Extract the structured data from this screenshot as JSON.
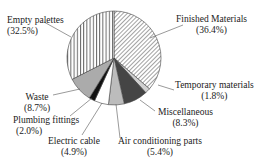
{
  "chart_data": {
    "type": "pie",
    "title": "",
    "start_angle_deg": 0,
    "direction": "clockwise",
    "slices": [
      {
        "label": "Finished Materials",
        "pct_label": "(36.4%)",
        "value": 36.4,
        "fill": "hatch-diag",
        "color": "#ffffff"
      },
      {
        "label": "Temporary materials",
        "pct_label": "(1.8%)",
        "value": 1.8,
        "fill": "solid",
        "color": "#d0d0d0"
      },
      {
        "label": "Miscellaneous",
        "pct_label": "(8.3%)",
        "value": 8.3,
        "fill": "solid",
        "color": "#454545"
      },
      {
        "label": "Air conditioning parts",
        "pct_label": "(5.4%)",
        "value": 5.4,
        "fill": "solid",
        "color": "#bcbcbc"
      },
      {
        "label": "Electric cable",
        "pct_label": "(4.9%)",
        "value": 4.9,
        "fill": "solid",
        "color": "#ffffff"
      },
      {
        "label": "Plumbing fittings",
        "pct_label": "(2.0%)",
        "value": 2.0,
        "fill": "solid",
        "color": "#111111"
      },
      {
        "label": "Waste",
        "pct_label": "(8.7%)",
        "value": 8.7,
        "fill": "solid",
        "color": "#ababab"
      },
      {
        "label": "Empty palettes",
        "pct_label": "(32.5%)",
        "value": 32.5,
        "fill": "stripe-vert",
        "color": "#ffffff"
      }
    ],
    "legend": "none (callout labels)"
  },
  "labels": {
    "finished": {
      "name": "Finished Materials",
      "pct": "(36.4%)"
    },
    "temporary": {
      "name": "Temporary materials",
      "pct": "(1.8%)"
    },
    "misc": {
      "name": "Miscellaneous",
      "pct": "(8.3%)"
    },
    "aircon": {
      "name": "Air conditioning parts",
      "pct": "(5.4%)"
    },
    "cable": {
      "name": "Electric cable",
      "pct": "(4.9%)"
    },
    "plumbing": {
      "name": "Plumbing fittings",
      "pct": "(2.0%)"
    },
    "waste": {
      "name": "Waste",
      "pct": "(8.7%)"
    },
    "palettes": {
      "name": "Empty palettes",
      "pct": "(32.5%)"
    }
  }
}
